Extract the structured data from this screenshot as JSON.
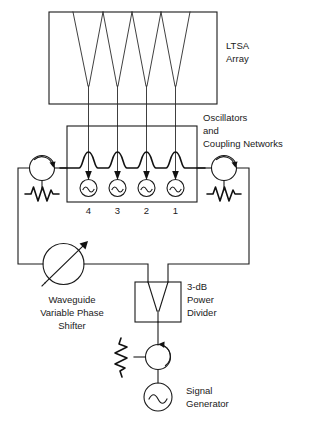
{
  "figure": {
    "background_color": "#ffffff",
    "line_color": "#1a1a1a"
  },
  "labels": {
    "ltsa_array_line1": "LTSA",
    "ltsa_array_line2": "Array",
    "oscillators_line1": "Oscillators",
    "oscillators_line2": "and",
    "oscillators_line3": "Coupling Networks",
    "phase_shifter_line1": "Waveguide",
    "phase_shifter_line2": "Variable Phase",
    "phase_shifter_line3": "Shifter",
    "power_divider_line1": "3-dB",
    "power_divider_line2": "Power",
    "power_divider_line3": "Divider",
    "signal_generator_line1": "Signal",
    "signal_generator_line2": "Generator"
  },
  "oscillator_numbers": [
    "4",
    "3",
    "2",
    "1"
  ],
  "components": {
    "ltsa_array": "ltsa-array-box",
    "oscillator_box": "oscillator-coupling-box",
    "circulator_left": "circulator",
    "circulator_right": "circulator",
    "circulator_bottom": "circulator",
    "termination_left": "matched-load-resistor",
    "termination_right": "matched-load-resistor",
    "termination_bottom": "matched-load-resistor",
    "phase_shifter": "variable-phase-shifter",
    "power_divider": "power-divider",
    "signal_generator": "signal-generator"
  }
}
